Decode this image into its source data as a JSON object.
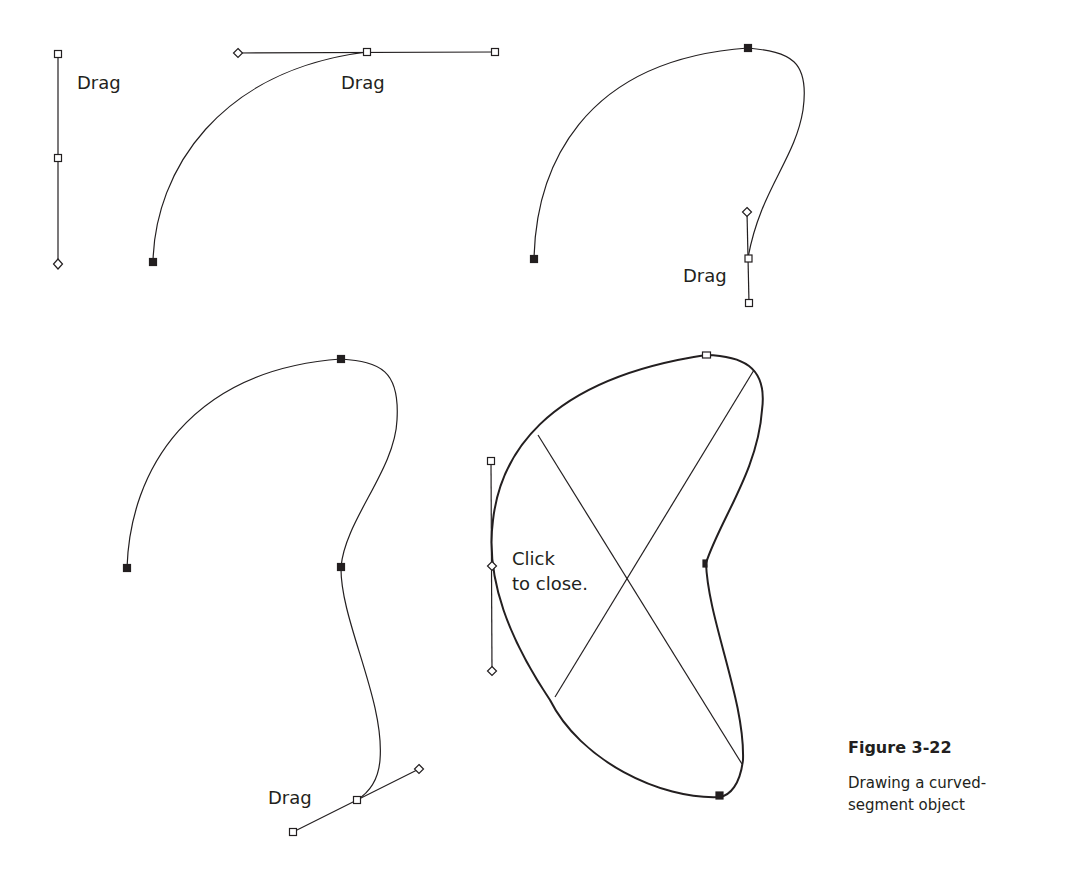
{
  "figure": {
    "title": "Figure 3-22",
    "caption_line1": "Drawing a curved-",
    "caption_line2": "segment object"
  },
  "steps": [
    {
      "id": "step1",
      "label": "Drag"
    },
    {
      "id": "step2",
      "label": "Drag"
    },
    {
      "id": "step3",
      "label": "Drag"
    },
    {
      "id": "step4",
      "label": "Drag"
    },
    {
      "id": "step5",
      "label_line1": "Click",
      "label_line2": "to close."
    }
  ],
  "colors": {
    "stroke": "#231f20",
    "background": "#ffffff"
  },
  "icons": {
    "anchor_point": "filled-square",
    "handle_point": "hollow-square",
    "direction_point": "hollow-diamond"
  }
}
